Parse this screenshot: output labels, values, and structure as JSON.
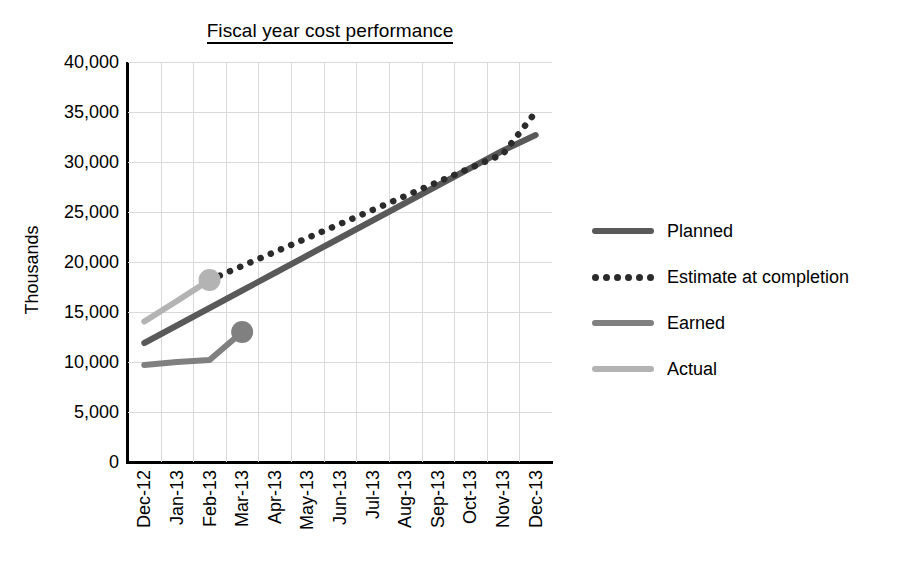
{
  "chart_data": {
    "type": "line",
    "title": "Fiscal year cost performance",
    "xlabel": "",
    "ylabel": "Thousands",
    "ylim": [
      0,
      40000
    ],
    "yticks": [
      "0",
      "5,000",
      "10,000",
      "15,000",
      "20,000",
      "25,000",
      "30,000",
      "35,000",
      "40,000"
    ],
    "ytick_values": [
      0,
      5000,
      10000,
      15000,
      20000,
      25000,
      30000,
      35000,
      40000
    ],
    "grid": true,
    "legend_position": "right",
    "categories": [
      "Dec-12",
      "Jan-13",
      "Feb-13",
      "Mar-13",
      "Apr-13",
      "May-13",
      "Jun-13",
      "Jul-13",
      "Aug-13",
      "Sep-13",
      "Oct-13",
      "Nov-13",
      "Dec-13"
    ],
    "series": [
      {
        "name": "Planned",
        "style": "solid",
        "color": "#595959",
        "marker": false,
        "values": [
          11900,
          13650,
          15400,
          17150,
          18900,
          20650,
          22400,
          24150,
          25900,
          27650,
          29400,
          31150,
          32700
        ]
      },
      {
        "name": "Estimate at completion",
        "style": "dotted",
        "color": "#2b2b2b",
        "marker": false,
        "values": [
          null,
          null,
          18200,
          19600,
          21000,
          22400,
          23800,
          25200,
          26600,
          28000,
          29400,
          30800,
          35000
        ]
      },
      {
        "name": "Earned",
        "style": "solid",
        "color": "#808080",
        "marker": true,
        "marker_at": "Mar-13",
        "values": [
          9700,
          10000,
          10200,
          13000,
          null,
          null,
          null,
          null,
          null,
          null,
          null,
          null,
          null
        ]
      },
      {
        "name": "Actual",
        "style": "solid",
        "color": "#b3b3b3",
        "marker": true,
        "marker_at": "Feb-13",
        "values": [
          14050,
          16100,
          18200,
          null,
          null,
          null,
          null,
          null,
          null,
          null,
          null,
          null,
          null
        ]
      }
    ]
  },
  "legend": {
    "items": [
      {
        "label": "Planned",
        "color": "#595959",
        "style": "solid"
      },
      {
        "label": "Estimate at completion",
        "color": "#2b2b2b",
        "style": "dotted"
      },
      {
        "label": "Earned",
        "color": "#808080",
        "style": "solid"
      },
      {
        "label": "Actual",
        "color": "#b3b3b3",
        "style": "solid"
      }
    ]
  }
}
